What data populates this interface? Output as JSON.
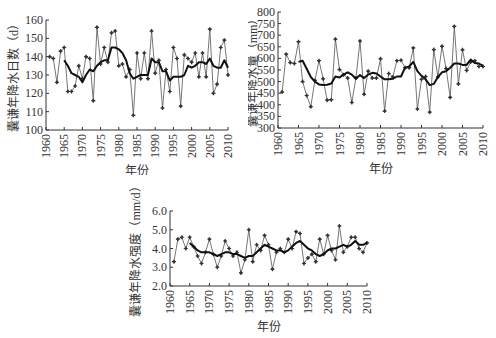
{
  "chart_data": [
    {
      "type": "line",
      "title": "",
      "xlabel": "年份",
      "ylabel": "囊谦年降水日数（d）",
      "xlim": [
        1960,
        2010
      ],
      "ylim": [
        100,
        160
      ],
      "xticks": [
        1960,
        1965,
        1970,
        1975,
        1980,
        1985,
        1990,
        1995,
        2000,
        2005,
        2010
      ],
      "yticks": [
        100,
        110,
        120,
        130,
        140,
        150,
        160
      ],
      "grid": false,
      "legend": null,
      "x": [
        1961,
        1962,
        1963,
        1964,
        1965,
        1966,
        1967,
        1968,
        1969,
        1970,
        1971,
        1972,
        1973,
        1974,
        1975,
        1976,
        1977,
        1978,
        1979,
        1980,
        1981,
        1982,
        1983,
        1984,
        1985,
        1986,
        1987,
        1988,
        1989,
        1990,
        1991,
        1992,
        1993,
        1994,
        1995,
        1996,
        1997,
        1998,
        1999,
        2000,
        2001,
        2002,
        2003,
        2004,
        2005,
        2006,
        2007,
        2008,
        2009,
        2010
      ],
      "series": [
        {
          "name": "annual",
          "style": "thin-marker",
          "values": [
            140,
            139,
            126,
            143,
            145,
            121,
            121,
            124,
            135,
            128,
            140,
            139,
            116,
            156,
            136,
            145,
            137,
            153,
            154,
            135,
            136,
            129,
            133,
            108,
            142,
            128,
            142,
            128,
            154,
            131,
            138,
            112,
            133,
            121,
            145,
            139,
            113,
            141,
            139,
            137,
            142,
            129,
            142,
            129,
            155,
            120,
            125,
            145,
            149,
            130
          ]
        },
        {
          "name": "moving-average",
          "style": "thick",
          "x": [
            1965,
            1966,
            1967,
            1968,
            1969,
            1970,
            1971,
            1972,
            1973,
            1974,
            1975,
            1976,
            1977,
            1978,
            1979,
            1980,
            1981,
            1982,
            1983,
            1984,
            1985,
            1986,
            1987,
            1988,
            1989,
            1990,
            1991,
            1992,
            1993,
            1994,
            1995,
            1996,
            1997,
            1998,
            1999,
            2000,
            2001,
            2002,
            2003,
            2004,
            2005,
            2006,
            2007,
            2008,
            2009,
            2010
          ],
          "values": [
            138,
            135,
            131,
            130,
            129,
            126,
            130,
            133,
            132,
            135,
            137,
            138,
            138,
            145,
            145,
            144,
            142,
            138,
            131,
            128,
            129,
            130,
            130,
            130,
            139,
            137,
            137,
            132,
            132,
            127,
            129,
            129,
            129,
            130,
            135,
            134,
            135,
            137,
            137,
            136,
            139,
            135,
            134,
            134,
            138,
            134
          ]
        }
      ]
    },
    {
      "type": "line",
      "title": "",
      "xlabel": "年份",
      "ylabel": "囊谦年降水量（mm）",
      "xlim": [
        1960,
        2010
      ],
      "ylim": [
        300,
        800
      ],
      "xticks": [
        1960,
        1965,
        1970,
        1975,
        1980,
        1985,
        1990,
        1995,
        2000,
        2005,
        2010
      ],
      "yticks": [
        300,
        350,
        400,
        450,
        500,
        550,
        600,
        650,
        700,
        750,
        800
      ],
      "grid": false,
      "legend": null,
      "x": [
        1961,
        1962,
        1963,
        1964,
        1965,
        1966,
        1967,
        1968,
        1969,
        1970,
        1971,
        1972,
        1973,
        1974,
        1975,
        1976,
        1977,
        1978,
        1979,
        1980,
        1981,
        1982,
        1983,
        1984,
        1985,
        1986,
        1987,
        1988,
        1989,
        1990,
        1991,
        1992,
        1993,
        1994,
        1995,
        1996,
        1997,
        1998,
        1999,
        2000,
        2001,
        2002,
        2003,
        2004,
        2005,
        2006,
        2007,
        2008,
        2009,
        2010
      ],
      "series": [
        {
          "name": "annual",
          "style": "thin-marker",
          "values": [
            455,
            618,
            582,
            578,
            672,
            500,
            440,
            392,
            505,
            590,
            512,
            420,
            422,
            683,
            552,
            530,
            515,
            410,
            515,
            675,
            445,
            545,
            515,
            515,
            598,
            373,
            535,
            520,
            590,
            592,
            560,
            560,
            645,
            382,
            510,
            522,
            368,
            638,
            520,
            652,
            556,
            432,
            738,
            490,
            637,
            548,
            585,
            590,
            565,
            565
          ]
        },
        {
          "name": "moving-average",
          "style": "thick",
          "x": [
            1965,
            1966,
            1967,
            1968,
            1969,
            1970,
            1971,
            1972,
            1973,
            1974,
            1975,
            1976,
            1977,
            1978,
            1979,
            1980,
            1981,
            1982,
            1983,
            1984,
            1985,
            1986,
            1987,
            1988,
            1989,
            1990,
            1991,
            1992,
            1993,
            1994,
            1995,
            1996,
            1997,
            1998,
            1999,
            2000,
            2001,
            2002,
            2003,
            2004,
            2005,
            2006,
            2007,
            2008,
            2009,
            2010
          ],
          "values": [
            585,
            590,
            555,
            520,
            500,
            488,
            485,
            486,
            492,
            522,
            518,
            530,
            540,
            530,
            512,
            528,
            515,
            530,
            538,
            535,
            522,
            510,
            510,
            512,
            522,
            522,
            560,
            565,
            585,
            545,
            525,
            510,
            485,
            490,
            520,
            540,
            545,
            560,
            578,
            578,
            572,
            572,
            595,
            580,
            578,
            568
          ]
        }
      ]
    },
    {
      "type": "line",
      "title": "",
      "xlabel": "年份",
      "ylabel": "囊谦年降水强度（mm/d）",
      "xlim": [
        1960,
        2010
      ],
      "ylim": [
        2.0,
        6.0
      ],
      "xticks": [
        1960,
        1965,
        1970,
        1975,
        1980,
        1985,
        1990,
        1995,
        2000,
        2005,
        2010
      ],
      "yticks": [
        "2.0",
        "3.0",
        "4.0",
        "5.0",
        "6.0"
      ],
      "grid": false,
      "legend": null,
      "x": [
        1961,
        1962,
        1963,
        1964,
        1965,
        1966,
        1967,
        1968,
        1969,
        1970,
        1971,
        1972,
        1973,
        1974,
        1975,
        1976,
        1977,
        1978,
        1979,
        1980,
        1981,
        1982,
        1983,
        1984,
        1985,
        1986,
        1987,
        1988,
        1989,
        1990,
        1991,
        1992,
        1993,
        1994,
        1995,
        1996,
        1997,
        1998,
        1999,
        2000,
        2001,
        2002,
        2003,
        2004,
        2005,
        2006,
        2007,
        2008,
        2009,
        2010
      ],
      "series": [
        {
          "name": "annual",
          "style": "thin-marker",
          "values": [
            3.3,
            4.5,
            4.6,
            4.0,
            4.6,
            4.1,
            3.6,
            3.2,
            3.8,
            4.5,
            3.7,
            3.0,
            3.6,
            4.4,
            4.0,
            3.6,
            3.8,
            2.7,
            3.4,
            5.0,
            3.3,
            4.2,
            3.9,
            4.7,
            4.2,
            2.9,
            3.8,
            4.0,
            3.8,
            4.5,
            4.0,
            4.9,
            4.8,
            3.2,
            3.5,
            3.7,
            3.3,
            4.5,
            3.7,
            4.7,
            3.9,
            3.4,
            5.2,
            3.8,
            4.1,
            4.6,
            4.6,
            4.0,
            3.8,
            4.3
          ]
        },
        {
          "name": "moving-average",
          "style": "thick",
          "x": [
            1965,
            1966,
            1967,
            1968,
            1969,
            1970,
            1971,
            1972,
            1973,
            1974,
            1975,
            1976,
            1977,
            1978,
            1979,
            1980,
            1981,
            1982,
            1983,
            1984,
            1985,
            1986,
            1987,
            1988,
            1989,
            1990,
            1991,
            1992,
            1993,
            1994,
            1995,
            1996,
            1997,
            1998,
            1999,
            2000,
            2001,
            2002,
            2003,
            2004,
            2005,
            2006,
            2007,
            2008,
            2009,
            2010
          ],
          "values": [
            4.3,
            4.1,
            3.9,
            3.8,
            3.8,
            3.8,
            3.7,
            3.6,
            3.7,
            3.8,
            3.8,
            3.7,
            3.7,
            3.6,
            3.5,
            3.6,
            3.6,
            3.8,
            4.0,
            4.2,
            4.1,
            4.0,
            3.9,
            3.9,
            3.8,
            3.9,
            4.1,
            4.3,
            4.4,
            4.2,
            4.0,
            3.9,
            3.7,
            3.6,
            3.7,
            3.9,
            4.0,
            4.0,
            4.1,
            4.2,
            4.1,
            4.2,
            4.4,
            4.2,
            4.2,
            4.3
          ]
        }
      ]
    }
  ]
}
